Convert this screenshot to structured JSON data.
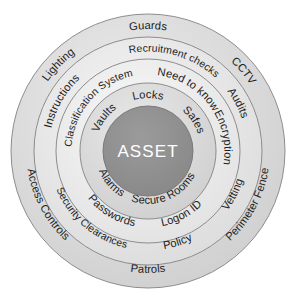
{
  "diagram": {
    "center": {
      "label": "ASSET",
      "fill": "#8f8f8f",
      "text_color": "#ffffff"
    },
    "geometry": {
      "cx": 148,
      "cy": 151,
      "r_outer": 137,
      "r2": 114,
      "r3": 92,
      "r4": 68,
      "r_core": 45
    },
    "rings": [
      {
        "index": 1,
        "name": "physical-perimeter-ring",
        "fill": "#d8d8d8",
        "stroke": "#8d8d8d",
        "labels": [
          {
            "text": "Guards",
            "angle": -90
          },
          {
            "text": "CCTV",
            "angle": -40
          },
          {
            "text": "Perimeter Fence",
            "angle": 28
          },
          {
            "text": "Patrols",
            "angle": 90
          },
          {
            "text": "Access Controls",
            "angle": 152
          },
          {
            "text": "Lighting",
            "angle": -136
          }
        ]
      },
      {
        "index": 2,
        "name": "personnel-procedural-ring",
        "fill": "#e6e6e6",
        "stroke": "#8d8d8d",
        "labels": [
          {
            "text": "Recruitment checks",
            "angle": -74
          },
          {
            "text": "Audits",
            "angle": -28
          },
          {
            "text": "Vetting",
            "angle": 27
          },
          {
            "text": "Policy",
            "angle": 72
          },
          {
            "text": "Security Clearances",
            "angle": 130
          },
          {
            "text": "Instructions",
            "angle": -150
          }
        ]
      },
      {
        "index": 3,
        "name": "information-control-ring",
        "fill": "#ededed",
        "stroke": "#8d8d8d",
        "labels": [
          {
            "text": "Need to know",
            "angle": -57
          },
          {
            "text": "Encryption",
            "angle": -10
          },
          {
            "text": "Logon ID",
            "angle": 62
          },
          {
            "text": "Passwords",
            "angle": 121
          },
          {
            "text": "Classification System",
            "angle": -139
          }
        ]
      },
      {
        "index": 4,
        "name": "inner-protection-ring",
        "fill": "#dcdcdc",
        "stroke": "#8d8d8d",
        "labels": [
          {
            "text": "Locks",
            "angle": -90
          },
          {
            "text": "Safes",
            "angle": -34
          },
          {
            "text": "Secure Rooms",
            "angle": 68
          },
          {
            "text": "Alarms",
            "angle": 139
          },
          {
            "text": "Vaults",
            "angle": -143
          }
        ]
      }
    ]
  }
}
